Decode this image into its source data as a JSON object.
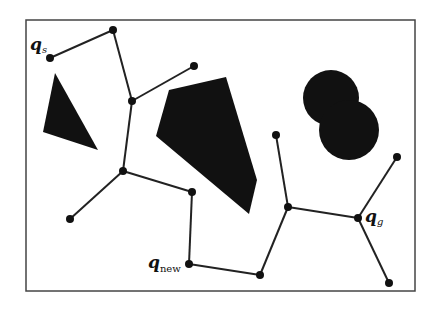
{
  "diagram": {
    "type": "rrt-tree-with-obstacles",
    "frame": {
      "x": 26,
      "y": 20,
      "width": 389,
      "height": 271,
      "stroke": "#444444"
    },
    "colors": {
      "obstacle": "#111111",
      "edge": "#222222",
      "node": "#111111",
      "background": "#ffffff"
    },
    "labels": {
      "start": {
        "main": "q",
        "sub": "s"
      },
      "goal": {
        "main": "q",
        "sub": "g"
      },
      "new": {
        "main": "q",
        "sub": "new"
      }
    },
    "obstacles": [
      {
        "id": "triangle",
        "shape": "polygon",
        "points": "55,73 43,132 98,150"
      },
      {
        "id": "pentagon",
        "shape": "polygon",
        "points": "169,90 226,77 257,180 249,214 156,136"
      },
      {
        "id": "circle-upper",
        "shape": "circle",
        "cx": 331,
        "cy": 98,
        "r": 28
      },
      {
        "id": "circle-lower",
        "shape": "circle",
        "cx": 349,
        "cy": 130,
        "r": 30
      }
    ],
    "nodes": [
      {
        "id": "qs",
        "x": 50,
        "y": 58
      },
      {
        "id": "n1",
        "x": 113,
        "y": 30
      },
      {
        "id": "n2",
        "x": 132,
        "y": 101
      },
      {
        "id": "n3",
        "x": 194,
        "y": 66
      },
      {
        "id": "n4",
        "x": 123,
        "y": 171
      },
      {
        "id": "n5",
        "x": 70,
        "y": 219
      },
      {
        "id": "n6",
        "x": 192,
        "y": 192
      },
      {
        "id": "qnew",
        "x": 189,
        "y": 264
      },
      {
        "id": "n7",
        "x": 260,
        "y": 275
      },
      {
        "id": "n8",
        "x": 288,
        "y": 207
      },
      {
        "id": "n9",
        "x": 276,
        "y": 135
      },
      {
        "id": "qg",
        "x": 358,
        "y": 218
      },
      {
        "id": "n10",
        "x": 397,
        "y": 157
      },
      {
        "id": "n11",
        "x": 389,
        "y": 283
      }
    ],
    "edges": [
      [
        "qs",
        "n1"
      ],
      [
        "n1",
        "n2"
      ],
      [
        "n2",
        "n3"
      ],
      [
        "n2",
        "n4"
      ],
      [
        "n4",
        "n5"
      ],
      [
        "n4",
        "n6"
      ],
      [
        "n6",
        "qnew"
      ],
      [
        "qnew",
        "n7"
      ],
      [
        "n7",
        "n8"
      ],
      [
        "n8",
        "n9"
      ],
      [
        "n8",
        "qg"
      ],
      [
        "qg",
        "n10"
      ],
      [
        "qg",
        "n11"
      ]
    ]
  }
}
